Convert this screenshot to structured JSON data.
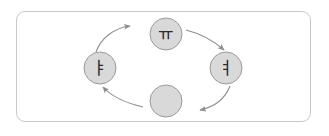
{
  "diagram": {
    "title": "",
    "frame": {
      "border_color": "#c9c9c9",
      "background_color": "#ffffff"
    },
    "node_style": {
      "fill_color": "#d9d9d9",
      "stroke_color": "#9a9a9a",
      "radius": 16
    },
    "edge_style": {
      "stroke_color": "#8d8d8d",
      "arrow_color": "#8d8d8d",
      "direction": "clockwise"
    },
    "nodes": [
      {
        "id": "top",
        "label": "ㅠ",
        "cx": 166,
        "cy": 34
      },
      {
        "id": "right",
        "label": "ㅕ",
        "cx": 226,
        "cy": 68
      },
      {
        "id": "bottom",
        "label": "",
        "cx": 166,
        "cy": 101
      },
      {
        "id": "left",
        "label": "ㅑ",
        "cx": 100,
        "cy": 68
      }
    ],
    "edges": [
      {
        "id": "left-to-top",
        "from": "left",
        "to": "top",
        "arrowhead": true
      },
      {
        "id": "top-to-right",
        "from": "top",
        "to": "right",
        "arrowhead": true
      },
      {
        "id": "right-to-bottom",
        "from": "right",
        "to": "bottom",
        "arrowhead": true
      },
      {
        "id": "bottom-to-left",
        "from": "bottom",
        "to": "left",
        "arrowhead": true
      }
    ]
  }
}
